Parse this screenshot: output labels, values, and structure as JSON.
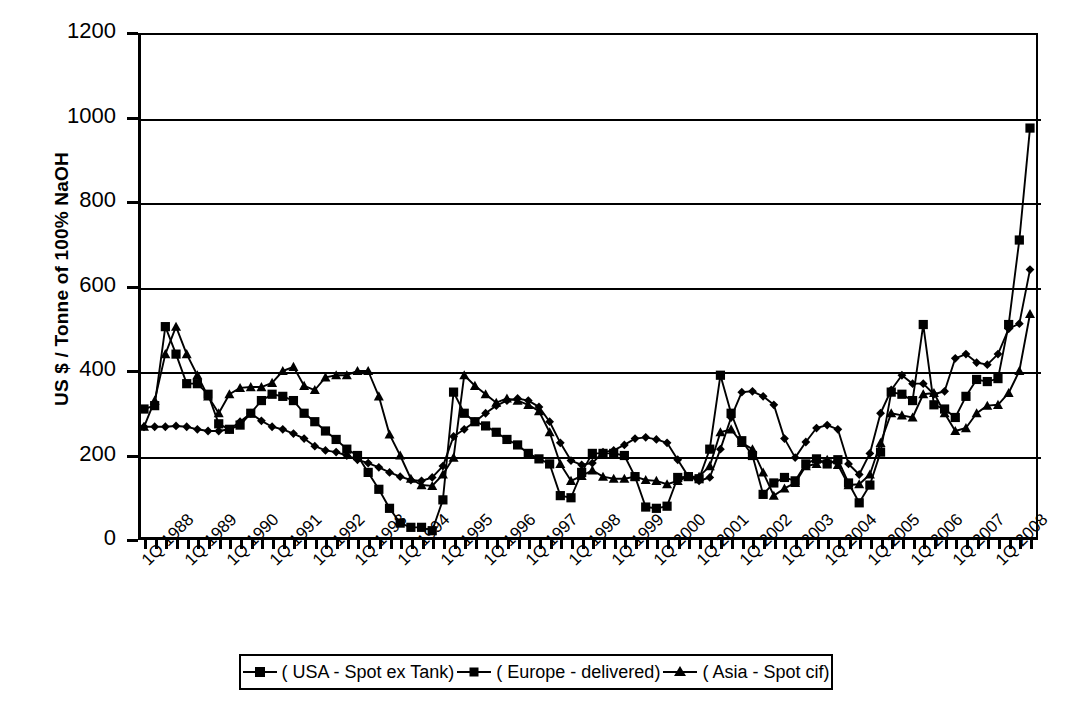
{
  "chart_data": {
    "type": "line",
    "title": "",
    "xlabel": "",
    "ylabel": "US $ / Tonne of 100% NaOH",
    "ylim": [
      0,
      1200
    ],
    "ytick_values": [
      0,
      200,
      400,
      600,
      800,
      1000,
      1200
    ],
    "ytick_labels": [
      "0",
      "200",
      "400",
      "600",
      "800",
      "1000",
      "1200"
    ],
    "grid": true,
    "legend_position": "bottom",
    "x_tick_labels": [
      "1Q 1988",
      "1Q 1989",
      "1Q 1990",
      "1Q 1991",
      "1Q 1992",
      "1Q 1993",
      "1Q 1994",
      "1Q 1995",
      "1Q 1996",
      "1Q 1997",
      "1Q 1998",
      "1Q 1999",
      "1Q 2000",
      "1Q 2001",
      "1Q 2002",
      "1Q 2003",
      "1Q 2004",
      "1Q 2005",
      "1Q 2006",
      "1Q 2007",
      "1Q 2008"
    ],
    "x": [
      "1Q 1988",
      "2Q 1988",
      "3Q 1988",
      "4Q 1988",
      "1Q 1989",
      "2Q 1989",
      "3Q 1989",
      "4Q 1989",
      "1Q 1990",
      "2Q 1990",
      "3Q 1990",
      "4Q 1990",
      "1Q 1991",
      "2Q 1991",
      "3Q 1991",
      "4Q 1991",
      "1Q 1992",
      "2Q 1992",
      "3Q 1992",
      "4Q 1992",
      "1Q 1993",
      "2Q 1993",
      "3Q 1993",
      "4Q 1993",
      "1Q 1994",
      "2Q 1994",
      "3Q 1994",
      "4Q 1994",
      "1Q 1995",
      "2Q 1995",
      "3Q 1995",
      "4Q 1995",
      "1Q 1996",
      "2Q 1996",
      "3Q 1996",
      "4Q 1996",
      "1Q 1997",
      "2Q 1997",
      "3Q 1997",
      "4Q 1997",
      "1Q 1998",
      "2Q 1998",
      "3Q 1998",
      "4Q 1998",
      "1Q 1999",
      "2Q 1999",
      "3Q 1999",
      "4Q 1999",
      "1Q 2000",
      "2Q 2000",
      "3Q 2000",
      "4Q 2000",
      "1Q 2001",
      "2Q 2001",
      "3Q 2001",
      "4Q 2001",
      "1Q 2002",
      "2Q 2002",
      "3Q 2002",
      "4Q 2002",
      "1Q 2003",
      "2Q 2003",
      "3Q 2003",
      "4Q 2003",
      "1Q 2004",
      "2Q 2004",
      "3Q 2004",
      "4Q 2004",
      "1Q 2005",
      "2Q 2005",
      "3Q 2005",
      "4Q 2005",
      "1Q 2006",
      "2Q 2006",
      "3Q 2006",
      "4Q 2006",
      "1Q 2007",
      "2Q 2007",
      "3Q 2007",
      "4Q 2007",
      "1Q 2008",
      "2Q 2008",
      "3Q 2008",
      "4Q 2008"
    ],
    "series": [
      {
        "name": "( USA - Spot ex Tank)",
        "marker": "square",
        "color": "#000000",
        "values": [
          310,
          318,
          505,
          440,
          370,
          370,
          345,
          275,
          262,
          272,
          300,
          330,
          345,
          340,
          330,
          300,
          280,
          258,
          238,
          215,
          200,
          160,
          120,
          75,
          40,
          30,
          30,
          22,
          95,
          350,
          300,
          280,
          270,
          255,
          238,
          225,
          205,
          192,
          180,
          105,
          100,
          160,
          205,
          205,
          205,
          200,
          150,
          78,
          75,
          80,
          148,
          150,
          145,
          215,
          390,
          300,
          235,
          200,
          108,
          135,
          148,
          140,
          180,
          192,
          180,
          190,
          135,
          88,
          130,
          208,
          350,
          345,
          330,
          510,
          320,
          310,
          290,
          340,
          380,
          375,
          382,
          510,
          710,
          975
        ]
      },
      {
        "name": "( Europe - delivered)",
        "marker": "diamond",
        "color": "#000000",
        "values": [
          268,
          268,
          268,
          270,
          268,
          262,
          258,
          258,
          262,
          280,
          300,
          282,
          268,
          262,
          252,
          240,
          222,
          212,
          208,
          200,
          190,
          182,
          172,
          160,
          150,
          142,
          140,
          148,
          175,
          245,
          262,
          280,
          300,
          318,
          330,
          335,
          330,
          315,
          280,
          230,
          188,
          178,
          182,
          208,
          212,
          225,
          240,
          243,
          238,
          230,
          190,
          150,
          140,
          148,
          215,
          290,
          350,
          352,
          340,
          320,
          240,
          195,
          232,
          265,
          272,
          262,
          180,
          155,
          205,
          300,
          355,
          390,
          370,
          370,
          345,
          352,
          430,
          440,
          420,
          415,
          440,
          500,
          512,
          640
        ]
      },
      {
        "name": "( Asia - Spot cif)",
        "marker": "triangle",
        "color": "#000000",
        "values": [
          268,
          330,
          440,
          505,
          440,
          390,
          340,
          300,
          345,
          360,
          362,
          362,
          372,
          400,
          410,
          365,
          355,
          385,
          390,
          390,
          400,
          400,
          340,
          250,
          200,
          145,
          130,
          128,
          155,
          195,
          390,
          365,
          345,
          325,
          335,
          330,
          320,
          305,
          255,
          180,
          140,
          152,
          165,
          150,
          145,
          145,
          150,
          142,
          140,
          132,
          140,
          150,
          150,
          175,
          255,
          262,
          230,
          215,
          160,
          105,
          122,
          135,
          175,
          180,
          190,
          178,
          130,
          132,
          155,
          230,
          300,
          295,
          290,
          345,
          348,
          300,
          258,
          265,
          300,
          318,
          320,
          348,
          400,
          535
        ]
      }
    ]
  },
  "legend": {
    "entries": [
      {
        "label": "( USA - Spot ex Tank)",
        "marker": "square"
      },
      {
        "label": "( Europe - delivered)",
        "marker": "diamond"
      },
      {
        "label": "( Asia - Spot cif)",
        "marker": "triangle"
      }
    ]
  },
  "axes": {
    "y_title": "US $ / Tonne of 100% NaOH"
  }
}
